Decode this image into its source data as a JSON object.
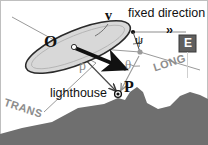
{
  "figure": {
    "type": "geometry-diagram",
    "background_color": "#ffffff",
    "ink_color": "#111111",
    "gray_color": "#8d8d8d",
    "land_color": "#6f6f6f",
    "ship_fill": "#d8d8d8",
    "border_color": "#b9b9b9"
  },
  "labels": {
    "observer": "O",
    "velocity": "v",
    "fixed_direction": "fixed direction",
    "fixed_direction_arrows": "››",
    "psi": "ψ",
    "theta": "θ",
    "rho": "ρ",
    "east_badge": "E",
    "long_axis": "LONG",
    "trans_axis": "TRANS",
    "lighthouse": "lighthouse",
    "point_p": "P"
  },
  "geometry": {
    "ship_center": [
      78,
      47
    ],
    "ship_rx": 56,
    "ship_ry": 17,
    "ship_rotation_deg": -22,
    "pivot_point": [
      74,
      47
    ],
    "velocity_arrow_from": [
      74,
      47
    ],
    "velocity_arrow_to": [
      128,
      70
    ],
    "fixed_direction_dot": [
      133,
      32
    ],
    "fixed_direction_line_to": [
      188,
      32
    ],
    "vertex_point": [
      140,
      52
    ],
    "target_point_p": [
      118,
      94
    ],
    "psi_vertex": [
      133,
      32
    ],
    "theta_vertex": [
      140,
      52
    ],
    "canvas": [
      208,
      145
    ]
  },
  "coastline_points": "0,145 0,134 22,128 52,122 78,108 104,104 118,98 125,100 130,92 137,87 143,92 147,103 158,109 170,106 180,96 190,92 200,95 208,99 208,145",
  "chart_data": {
    "type": "scatter",
    "annotations": [
      "O",
      "v",
      "fixed direction",
      "ψ",
      "θ",
      "ρ",
      "E",
      "LONG",
      "TRANS",
      "lighthouse",
      "P"
    ]
  }
}
